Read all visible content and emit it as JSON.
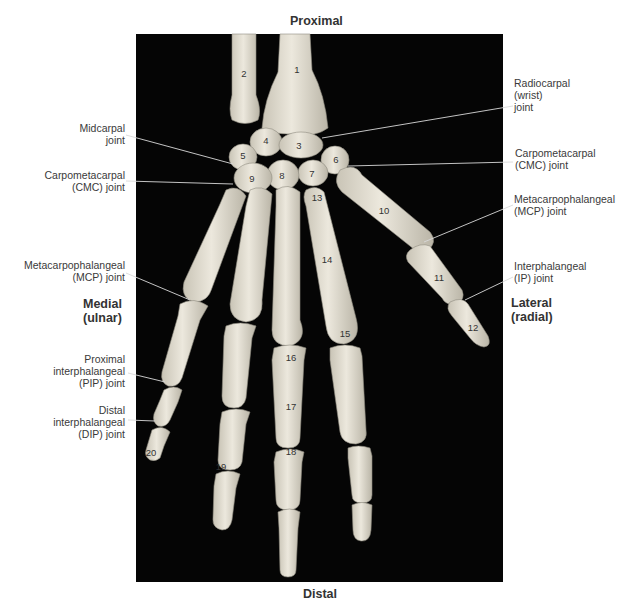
{
  "figure": {
    "orientation": {
      "top": "Proximal",
      "bottom": "Distal",
      "left": "Medial\n(ulnar)",
      "right": "Lateral\n(radial)"
    },
    "labels_left": [
      {
        "id": "midcarpal",
        "text": "Midcarpal\njoint"
      },
      {
        "id": "cmc-left",
        "text": "Carpometacarpal\n(CMC) joint"
      },
      {
        "id": "mcp-left",
        "text": "Metacarpophalangeal\n(MCP) joint"
      },
      {
        "id": "pip",
        "text": "Proximal\ninterphalangeal\n(PIP) joint"
      },
      {
        "id": "dip",
        "text": "Distal\ninterphalangeal\n(DIP) joint"
      }
    ],
    "labels_right": [
      {
        "id": "radiocarpal",
        "text": "Radiocarpal\n(wrist)\njoint"
      },
      {
        "id": "cmc-right",
        "text": "Carpometacarpal\n(CMC) joint"
      },
      {
        "id": "mcp-right",
        "text": "Metacarpophalangeal\n(MCP) joint"
      },
      {
        "id": "ip",
        "text": "Interphalangeal\n(IP) joint"
      }
    ],
    "bone_numbers": [
      "1",
      "2",
      "3",
      "4",
      "5",
      "6",
      "7",
      "8",
      "9",
      "10",
      "11",
      "12",
      "13",
      "14",
      "15",
      "16",
      "17",
      "18",
      "19",
      "20"
    ],
    "colors": {
      "background": "#ffffff",
      "panel": "#050505",
      "bone": "#e8e4d8",
      "bone_shadow": "#bdb8aa",
      "leader_line": "#d9d9d9",
      "label_text": "#3a3a3a"
    }
  }
}
